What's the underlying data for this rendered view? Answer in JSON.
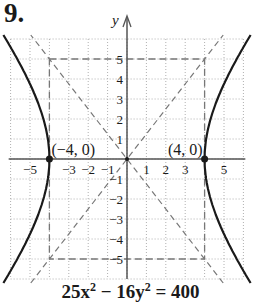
{
  "problem": {
    "number": "9."
  },
  "equation": {
    "lhs_a": "25x",
    "exp_a": "2",
    "minus": " − 16y",
    "exp_b": "2",
    "rhs": " = 400"
  },
  "colors": {
    "curve": "#1a1a1a",
    "axis": "#555555",
    "grid": "#b0b0b0",
    "dashed": "#777777",
    "text": "#1a1a1a"
  },
  "chart_data": {
    "type": "line",
    "xlabel": "",
    "ylabel": "y",
    "xlim": [
      -6,
      6
    ],
    "ylim": [
      -6,
      6
    ],
    "grid": true,
    "x_ticks": [
      "-5",
      "-3",
      "-2",
      "-1",
      "1",
      "2",
      "3",
      "5"
    ],
    "y_ticks": [
      "5",
      "4",
      "3",
      "2",
      "1",
      "-1",
      "-2",
      "-3",
      "-4",
      "-5"
    ],
    "series": [
      {
        "name": "hyperbola right branch",
        "style": "solid",
        "equation": "x = 4*sqrt(1 + y^2/25)"
      },
      {
        "name": "hyperbola left branch",
        "style": "solid",
        "equation": "x = -4*sqrt(1 + y^2/25)"
      },
      {
        "name": "asymptote",
        "style": "dashed",
        "equation": "y = 5/4 x"
      },
      {
        "name": "asymptote",
        "style": "dashed",
        "equation": "y = -5/4 x"
      },
      {
        "name": "fundamental rectangle",
        "style": "dashed",
        "corners": [
          [
            -4,
            5
          ],
          [
            4,
            5
          ],
          [
            4,
            -5
          ],
          [
            -4,
            -5
          ]
        ]
      }
    ],
    "annotations": [
      {
        "label": "(−4, 0)",
        "x": -4,
        "y": 0,
        "marker": "point"
      },
      {
        "label": "(4, 0)",
        "x": 4,
        "y": 0,
        "marker": "point"
      }
    ],
    "vertices": [
      [
        -4,
        0
      ],
      [
        4,
        0
      ]
    ]
  }
}
